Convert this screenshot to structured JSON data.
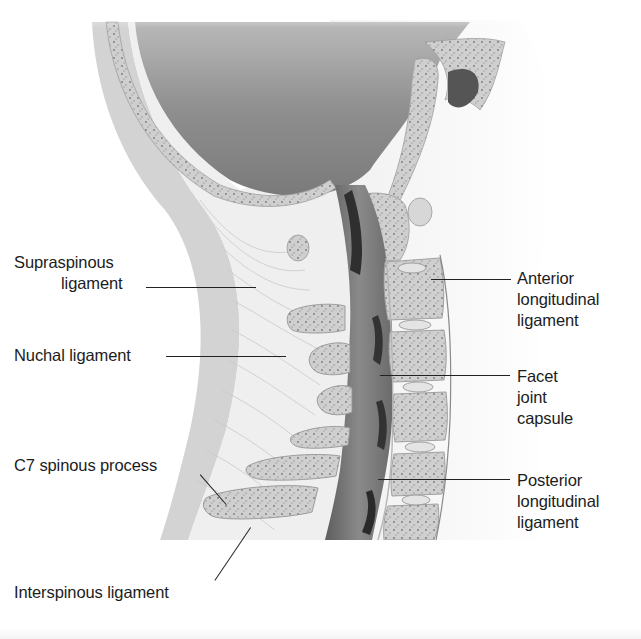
{
  "figure": {
    "labels_left": [
      {
        "id": "supraspinous",
        "lines": [
          "Supraspinous",
          "ligament"
        ]
      },
      {
        "id": "nuchal",
        "lines": [
          "Nuchal ligament"
        ]
      },
      {
        "id": "c7",
        "lines": [
          "C7 spinous process"
        ]
      },
      {
        "id": "interspinous",
        "lines": [
          "Interspinous ligament"
        ]
      }
    ],
    "labels_right": [
      {
        "id": "anterior",
        "lines": [
          "Anterior",
          "longitudinal",
          "ligament"
        ]
      },
      {
        "id": "facet",
        "lines": [
          "Facet",
          "joint",
          "capsule"
        ]
      },
      {
        "id": "posterior",
        "lines": [
          "Posterior",
          "longitudinal",
          "ligament"
        ]
      }
    ],
    "colors": {
      "background": "#ffffff",
      "skin_band": "#d2d2d2",
      "cranial_cavity": "#8a8a8a",
      "bone": "#cfcfcf",
      "spinal_cord": "#6e6e6e",
      "dark_space": "#2e2e2e",
      "ligament": "#ececec",
      "leader": "#222222"
    }
  }
}
